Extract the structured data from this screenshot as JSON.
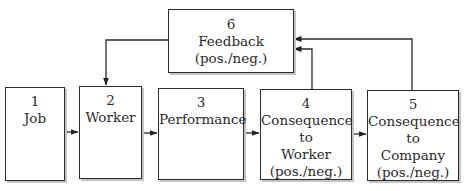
{
  "diagram": {
    "boxes": [
      {
        "id": "1",
        "number": "1",
        "lines": [
          "Job"
        ]
      },
      {
        "id": "2",
        "number": "2",
        "lines": [
          "Worker"
        ]
      },
      {
        "id": "3",
        "number": "3",
        "lines": [
          "Performance"
        ]
      },
      {
        "id": "4",
        "number": "4",
        "lines": [
          "Consequence to",
          "Worker",
          "(pos./neg.)"
        ]
      },
      {
        "id": "5",
        "number": "5",
        "lines": [
          "Consequence to",
          "Company",
          "(pos./neg.)"
        ]
      },
      {
        "id": "6",
        "number": "6",
        "lines": [
          "Feedback",
          "(pos./neg.)"
        ]
      }
    ],
    "edges": [
      {
        "from": "1",
        "to": "2"
      },
      {
        "from": "2",
        "to": "3"
      },
      {
        "from": "3",
        "to": "4"
      },
      {
        "from": "4",
        "to": "5"
      },
      {
        "from": "4",
        "to": "6"
      },
      {
        "from": "5",
        "to": "6"
      },
      {
        "from": "6",
        "to": "2"
      }
    ],
    "colors": {
      "line": "#2b2b2b",
      "shadow": "#c4c4c4",
      "background": "#ffffff"
    }
  }
}
